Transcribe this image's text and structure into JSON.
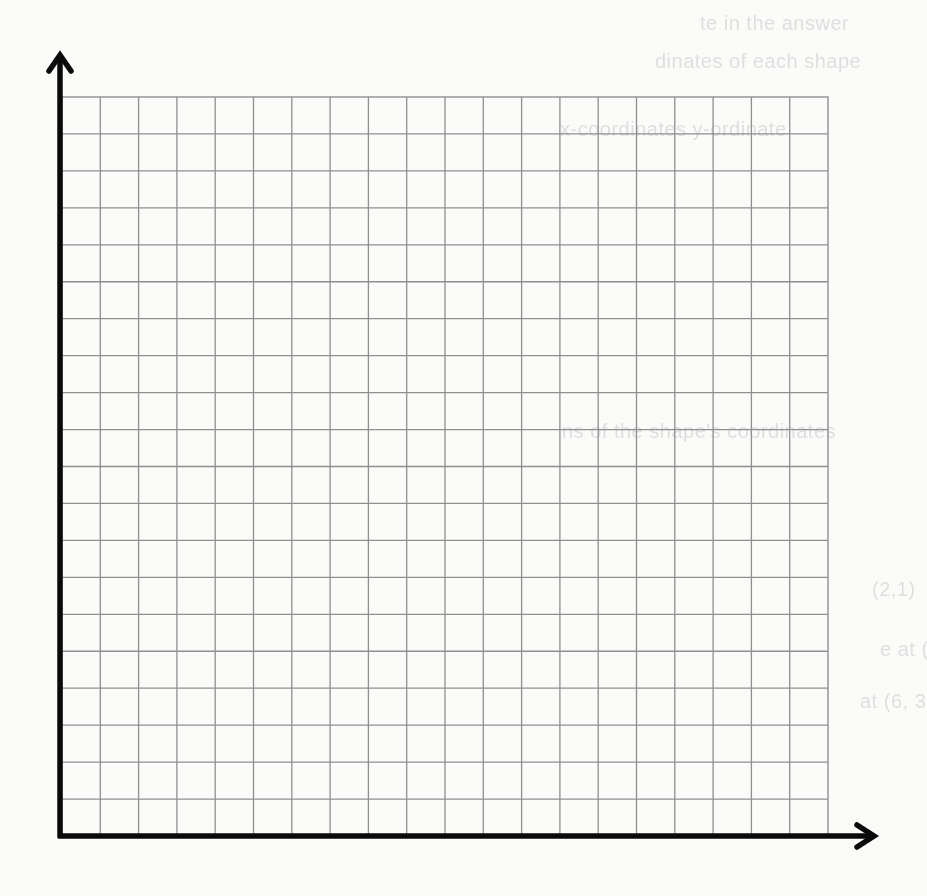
{
  "diagram": {
    "type": "blank coordinate grid",
    "grid": {
      "columns": 20,
      "rows": 20,
      "left": 62,
      "top": 97,
      "right": 828,
      "bottom": 836,
      "line_color": "#8f8f8f"
    },
    "axes": {
      "color": "#0a0a0a",
      "y_axis": {
        "x": 60,
        "top": 55,
        "bottom": 838
      },
      "x_axis": {
        "y": 836,
        "left": 58,
        "right": 874
      }
    },
    "background_color": "#fbfbfa"
  },
  "ghost_text": [
    {
      "text": "te in the answer",
      "x": 700,
      "y": 12
    },
    {
      "text": "dinates of each shape",
      "x": 655,
      "y": 50
    },
    {
      "text": "x-coordinates    y-ordinate",
      "x": 560,
      "y": 118
    },
    {
      "text": "ns of the shape's coordinates",
      "x": 562,
      "y": 420
    },
    {
      "text": "(2,1)",
      "x": 872,
      "y": 578
    },
    {
      "text": "e at (3",
      "x": 880,
      "y": 638
    },
    {
      "text": "at (6, 3)",
      "x": 860,
      "y": 690
    }
  ]
}
